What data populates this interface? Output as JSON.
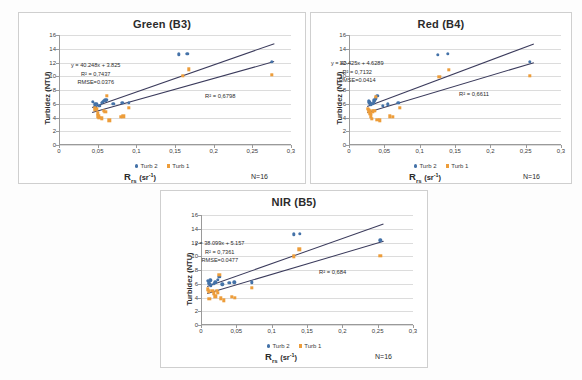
{
  "figure": {
    "panels": [
      "green",
      "red",
      "nir"
    ]
  },
  "chart_data": [
    {
      "type": "scatter",
      "title": "Green (B3)",
      "xlabel": "R_rs (sr-1)",
      "ylabel": "Turbidez (NTU)",
      "xlim": [
        0,
        0.3
      ],
      "ylim": [
        0,
        16
      ],
      "xticks": [
        "0",
        "0,05",
        "0,1",
        "0,15",
        "0,2",
        "0,25",
        "0,3"
      ],
      "yticks": [
        "0",
        "2",
        "4",
        "6",
        "8",
        "10",
        "12",
        "14",
        "16"
      ],
      "grid": true,
      "legend": [
        "Turb 2",
        "Turb 1"
      ],
      "legend_position": "bottom",
      "n_label": "N=16",
      "annotations": {
        "equation": "y = 40.248x + 3.825",
        "r2_primary": "R² = 0,7437",
        "rmse": "RMSE=0.0376",
        "r2_secondary": "R² = 0,6798"
      },
      "series": [
        {
          "name": "Turb 2",
          "color": "#4472a8",
          "points": [
            [
              0.044,
              6.3
            ],
            [
              0.046,
              5.9
            ],
            [
              0.047,
              5.6
            ],
            [
              0.048,
              6.0
            ],
            [
              0.052,
              5.7
            ],
            [
              0.055,
              6.1
            ],
            [
              0.057,
              6.3
            ],
            [
              0.058,
              6.4
            ],
            [
              0.06,
              6.5
            ],
            [
              0.062,
              6.6
            ],
            [
              0.07,
              6.0
            ],
            [
              0.082,
              6.1
            ],
            [
              0.09,
              6.1
            ],
            [
              0.155,
              13.2
            ],
            [
              0.166,
              13.3
            ],
            [
              0.275,
              12.1
            ]
          ]
        },
        {
          "name": "Turb 1",
          "color": "#ed9d3a",
          "points": [
            [
              0.046,
              5.4
            ],
            [
              0.047,
              5.1
            ],
            [
              0.049,
              5.3
            ],
            [
              0.05,
              4.6
            ],
            [
              0.051,
              4.2
            ],
            [
              0.052,
              4.0
            ],
            [
              0.055,
              3.9
            ],
            [
              0.058,
              5.0
            ],
            [
              0.06,
              4.8
            ],
            [
              0.062,
              7.2
            ],
            [
              0.065,
              3.6
            ],
            [
              0.08,
              4.1
            ],
            [
              0.083,
              4.2
            ],
            [
              0.09,
              5.4
            ],
            [
              0.16,
              10.1
            ],
            [
              0.168,
              11.0
            ],
            [
              0.275,
              10.2
            ]
          ]
        }
      ],
      "trendlines": [
        {
          "x0": 0.043,
          "y0": 5.55,
          "x1": 0.278,
          "y1": 14.8
        },
        {
          "x0": 0.043,
          "y0": 4.75,
          "x1": 0.278,
          "y1": 12.15
        }
      ]
    },
    {
      "type": "scatter",
      "title": "Red (B4)",
      "xlabel": "R_rs (sr-1)",
      "ylabel": "Turbidez (NTU)",
      "xlim": [
        0,
        0.3
      ],
      "ylim": [
        0,
        16
      ],
      "xticks": [
        "0",
        "0,05",
        "0,1",
        "0,15",
        "0,2",
        "0,25",
        "0,3"
      ],
      "yticks": [
        "0",
        "2",
        "4",
        "6",
        "8",
        "10",
        "12",
        "14",
        "16"
      ],
      "grid": true,
      "legend": [
        "Turb 2",
        "Turb 1"
      ],
      "legend_position": "bottom",
      "n_label": "N=16",
      "annotations": {
        "equation": "y = 40.425x + 4.6289",
        "r2_primary": "R² = 0,7132",
        "rmse": "RMSE=0.0414",
        "r2_secondary": "R² = 0,6611"
      },
      "series": [
        {
          "name": "Turb 2",
          "color": "#4472a8",
          "points": [
            [
              0.028,
              6.4
            ],
            [
              0.029,
              6.2
            ],
            [
              0.03,
              6.0
            ],
            [
              0.031,
              5.9
            ],
            [
              0.033,
              6.0
            ],
            [
              0.035,
              6.2
            ],
            [
              0.036,
              6.5
            ],
            [
              0.038,
              6.8
            ],
            [
              0.04,
              7.2
            ],
            [
              0.048,
              5.7
            ],
            [
              0.055,
              5.9
            ],
            [
              0.07,
              6.1
            ],
            [
              0.126,
              13.1
            ],
            [
              0.14,
              13.3
            ],
            [
              0.256,
              12.1
            ]
          ]
        },
        {
          "name": "Turb 1",
          "color": "#ed9d3a",
          "points": [
            [
              0.027,
              5.3
            ],
            [
              0.028,
              5.1
            ],
            [
              0.029,
              4.9
            ],
            [
              0.03,
              4.5
            ],
            [
              0.031,
              4.2
            ],
            [
              0.032,
              3.8
            ],
            [
              0.034,
              4.9
            ],
            [
              0.036,
              5.0
            ],
            [
              0.038,
              7.0
            ],
            [
              0.04,
              3.7
            ],
            [
              0.044,
              3.6
            ],
            [
              0.058,
              4.2
            ],
            [
              0.062,
              4.1
            ],
            [
              0.072,
              5.4
            ],
            [
              0.128,
              9.9
            ],
            [
              0.141,
              10.9
            ],
            [
              0.256,
              10.1
            ]
          ]
        }
      ],
      "trendlines": [
        {
          "x0": 0.026,
          "y0": 5.7,
          "x1": 0.262,
          "y1": 14.8
        },
        {
          "x0": 0.026,
          "y0": 4.85,
          "x1": 0.262,
          "y1": 12.1
        }
      ]
    },
    {
      "type": "scatter",
      "title": "NIR (B5)",
      "xlabel": "R_rs (sr-1)",
      "ylabel": "Turbidez (NTU)",
      "xlim": [
        0,
        0.3
      ],
      "ylim": [
        0,
        16
      ],
      "xticks": [
        "0",
        "0,05",
        "0,1",
        "0,15",
        "0,2",
        "0,25",
        "0,3"
      ],
      "yticks": [
        "0",
        "2",
        "4",
        "6",
        "8",
        "10",
        "12",
        "14",
        "16"
      ],
      "grid": true,
      "legend": [
        "Turb 2",
        "Turb 1"
      ],
      "legend_position": "bottom",
      "n_label": "N=16",
      "annotations": {
        "equation": "y = 38.099x + 5.157",
        "r2_primary": "R² = 0,7361",
        "rmse": "RMSE=0.0477",
        "r2_secondary": "R² = 0,684"
      },
      "series": [
        {
          "name": "Turb 2",
          "color": "#4472a8",
          "points": [
            [
              0.01,
              6.4
            ],
            [
              0.011,
              6.2
            ],
            [
              0.012,
              6.0
            ],
            [
              0.013,
              6.5
            ],
            [
              0.014,
              5.8
            ],
            [
              0.018,
              6.0
            ],
            [
              0.02,
              6.2
            ],
            [
              0.024,
              6.6
            ],
            [
              0.026,
              7.0
            ],
            [
              0.03,
              5.9
            ],
            [
              0.04,
              6.1
            ],
            [
              0.047,
              6.2
            ],
            [
              0.072,
              6.2
            ],
            [
              0.131,
              13.2
            ],
            [
              0.14,
              13.3
            ],
            [
              0.254,
              12.3
            ]
          ]
        },
        {
          "name": "Turb 1",
          "color": "#ed9d3a",
          "points": [
            [
              0.01,
              5.2
            ],
            [
              0.011,
              4.9
            ],
            [
              0.012,
              3.8
            ],
            [
              0.016,
              5.0
            ],
            [
              0.018,
              4.6
            ],
            [
              0.02,
              4.2
            ],
            [
              0.022,
              5.0
            ],
            [
              0.024,
              4.7
            ],
            [
              0.026,
              7.3
            ],
            [
              0.028,
              3.9
            ],
            [
              0.032,
              3.6
            ],
            [
              0.044,
              4.1
            ],
            [
              0.048,
              4.0
            ],
            [
              0.072,
              5.4
            ],
            [
              0.131,
              10.0
            ],
            [
              0.139,
              11.0
            ],
            [
              0.254,
              10.1
            ]
          ]
        }
      ],
      "trendlines": [
        {
          "x0": 0.008,
          "y0": 5.7,
          "x1": 0.258,
          "y1": 14.8
        },
        {
          "x0": 0.008,
          "y0": 4.7,
          "x1": 0.258,
          "y1": 12.3
        }
      ]
    }
  ]
}
